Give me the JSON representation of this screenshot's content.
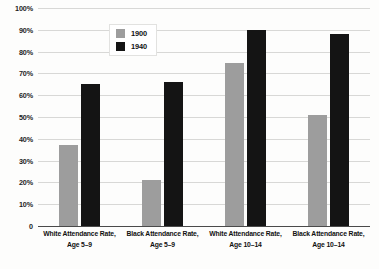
{
  "chart_data": {
    "type": "bar",
    "title": "",
    "subtitle": "",
    "xlabel": "",
    "ylabel": "",
    "ylim": [
      0,
      100
    ],
    "ytick_labels": [
      "100%",
      "90%",
      "80%",
      "70%",
      "60%",
      "50%",
      "40%",
      "30%",
      "20%",
      "10%",
      "0"
    ],
    "ytick_values": [
      100,
      90,
      80,
      70,
      60,
      50,
      40,
      30,
      20,
      10,
      0
    ],
    "grid": true,
    "legend_position": "upper-center",
    "categories": [
      "White Attendance Rate, Age 5–9",
      "Black Attendance Rate, Age 5–9",
      "White Attendance Rate, Age 10–14",
      "Black Attendance Rate, Age 10–14"
    ],
    "category_lines": [
      {
        "line1": "White Attendance Rate,",
        "line2": "Age 5–9"
      },
      {
        "line1": "Black Attendance Rate,",
        "line2": "Age 5–9"
      },
      {
        "line1": "White Attendance Rate,",
        "line2": "Age 10–14"
      },
      {
        "line1": "Black Attendance Rate,",
        "line2": "Age 10–14"
      }
    ],
    "series": [
      {
        "name": "1900",
        "color": "#9d9d9d",
        "values": [
          37,
          21,
          75,
          51
        ]
      },
      {
        "name": "1940",
        "color": "#141414",
        "values": [
          65,
          66,
          90,
          88
        ]
      }
    ]
  },
  "legend": {
    "entries": [
      {
        "label": "1900",
        "swatch": "legend-swatch-1900"
      },
      {
        "label": "1940",
        "swatch": "legend-swatch-1940"
      }
    ]
  }
}
